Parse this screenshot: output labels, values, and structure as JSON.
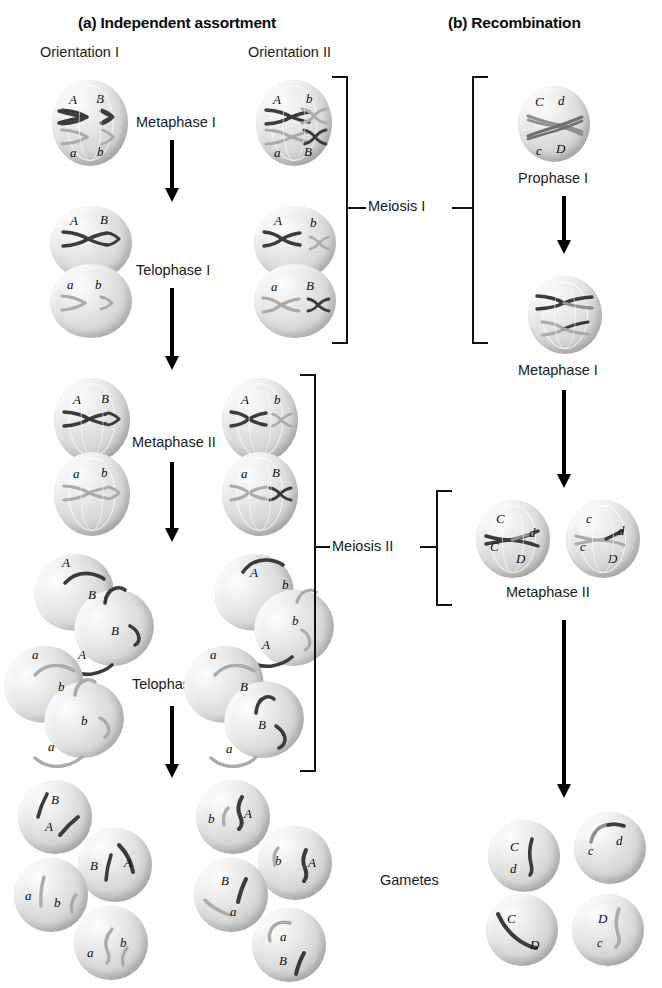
{
  "figure": {
    "title_a": "(a)  Independent assortment",
    "title_b": "(b)  Recombination"
  },
  "panel_a": {
    "orientation_1_label": "Orientation I",
    "orientation_2_label": "Orientation II",
    "phases": {
      "metaphase_1": "Metaphase I",
      "telophase_1": "Telophase I",
      "metaphase_2": "Metaphase II",
      "telophase_2": "Telophase II"
    },
    "orientation_1": {
      "metaphase_1_alleles": [
        "A",
        "B",
        "a",
        "b"
      ],
      "telophase_1_top_alleles": [
        "A",
        "B"
      ],
      "telophase_1_bottom_alleles": [
        "a",
        "b"
      ],
      "metaphase_2_top_alleles": [
        "A",
        "B"
      ],
      "metaphase_2_bottom_alleles": [
        "a",
        "b"
      ],
      "telophase_2_top_alleles": [
        "A",
        "B",
        "B",
        "A"
      ],
      "telophase_2_bottom_alleles": [
        "a",
        "b",
        "b",
        "a"
      ],
      "gametes": [
        {
          "alleles": [
            "B",
            "A"
          ]
        },
        {
          "alleles": [
            "B",
            "A"
          ]
        },
        {
          "alleles": [
            "a",
            "b"
          ]
        },
        {
          "alleles": [
            "a",
            "b"
          ]
        }
      ]
    },
    "orientation_2": {
      "metaphase_1_alleles": [
        "A",
        "b",
        "a",
        "B"
      ],
      "telophase_1_top_alleles": [
        "A",
        "b"
      ],
      "telophase_1_bottom_alleles": [
        "a",
        "B"
      ],
      "metaphase_2_top_alleles": [
        "A",
        "b"
      ],
      "metaphase_2_bottom_alleles": [
        "a",
        "B"
      ],
      "telophase_2_top_alleles": [
        "A",
        "b",
        "b",
        "A"
      ],
      "telophase_2_bottom_alleles": [
        "a",
        "B",
        "B",
        "a"
      ],
      "gametes": [
        {
          "alleles": [
            "b",
            "A"
          ]
        },
        {
          "alleles": [
            "b",
            "A"
          ]
        },
        {
          "alleles": [
            "B",
            "a"
          ]
        },
        {
          "alleles": [
            "a",
            "B"
          ]
        }
      ]
    }
  },
  "panel_b": {
    "phases": {
      "prophase_1": "Prophase I",
      "metaphase_1": "Metaphase I",
      "metaphase_2": "Metaphase II"
    },
    "prophase_1_alleles": [
      "C",
      "d",
      "c",
      "D"
    ],
    "metaphase_1_alleles": [],
    "metaphase_2_left_alleles": [
      "C",
      "d",
      "C",
      "D"
    ],
    "metaphase_2_right_alleles": [
      "c",
      "d",
      "c",
      "D"
    ],
    "gametes": [
      {
        "alleles": [
          "C",
          "d"
        ]
      },
      {
        "alleles": [
          "c",
          "d"
        ]
      },
      {
        "alleles": [
          "C",
          "D"
        ]
      },
      {
        "alleles": [
          "D",
          "c"
        ]
      }
    ]
  },
  "brackets": {
    "meiosis_1": "Meiosis I",
    "meiosis_2": "Meiosis II"
  },
  "labels": {
    "gametes": "Gametes"
  },
  "colors": {
    "chromosome_dark": "#3a3a3a",
    "chromosome_light": "#a8a8a8",
    "cell_fill": "#d8d8d8",
    "text": "#111111"
  }
}
